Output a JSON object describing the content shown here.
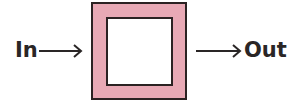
{
  "diagram": {
    "type": "block-diagram",
    "input": {
      "label": "In"
    },
    "output": {
      "label": "Out"
    },
    "block": {
      "fill_color": "#e8a9b5",
      "border_color": "#2b2222",
      "inner_fill_color": "#ffffff"
    },
    "arrows": [
      {
        "from": "In",
        "to": "block"
      },
      {
        "from": "block",
        "to": "Out"
      }
    ]
  }
}
